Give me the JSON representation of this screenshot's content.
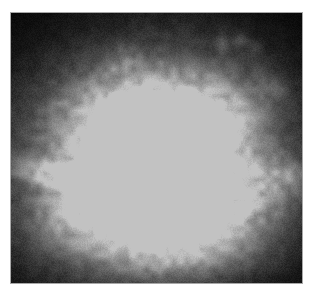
{
  "figure": {
    "kind": "astronomical-grayscale-image",
    "colormap": "grayscale",
    "background_color": "#000000",
    "page_color": "#ffffff",
    "border_color": "#a8a8a8",
    "panel": {
      "x": 10,
      "y": 12,
      "width": 293,
      "height": 272
    },
    "peak_brightness_hex": "#c2c2c2",
    "noise": {
      "type": "speckle",
      "amplitude": 18
    }
  },
  "chart_data": {
    "type": "heatmap",
    "title": "",
    "xlabel": "",
    "ylabel": "",
    "grid": false,
    "legend": "none",
    "xlim": [
      0,
      293
    ],
    "ylim": [
      0,
      272
    ],
    "value_range": [
      0,
      194
    ],
    "colormap": "gray",
    "sources": [
      {
        "name": "core",
        "cx": 145,
        "cy": 150,
        "rx": 46,
        "ry": 42,
        "peak": 194,
        "angle": 0
      },
      {
        "name": "inner-halo",
        "cx": 143,
        "cy": 152,
        "rx": 84,
        "ry": 74,
        "peak": 140,
        "angle": 0
      },
      {
        "name": "main-envelope",
        "cx": 140,
        "cy": 150,
        "rx": 130,
        "ry": 112,
        "peak": 96,
        "angle": -8
      },
      {
        "name": "outer-envelope",
        "cx": 138,
        "cy": 152,
        "rx": 158,
        "ry": 134,
        "peak": 52,
        "angle": -8
      },
      {
        "name": "upper-lobe",
        "cx": 130,
        "cy": 95,
        "rx": 86,
        "ry": 42,
        "peak": 78,
        "angle": -6
      },
      {
        "name": "upper-right-shoulder",
        "cx": 206,
        "cy": 110,
        "rx": 54,
        "ry": 38,
        "peak": 70,
        "angle": -20
      },
      {
        "name": "left-filament",
        "cx": 60,
        "cy": 160,
        "rx": 62,
        "ry": 9,
        "peak": 96,
        "angle": 10
      },
      {
        "name": "left-filament-outer",
        "cx": 28,
        "cy": 166,
        "rx": 34,
        "ry": 6,
        "peak": 58,
        "angle": 12
      },
      {
        "name": "right-spur",
        "cx": 252,
        "cy": 168,
        "rx": 42,
        "ry": 30,
        "peak": 58,
        "angle": 0
      },
      {
        "name": "right-spur-far",
        "cx": 280,
        "cy": 162,
        "rx": 22,
        "ry": 16,
        "peak": 40,
        "angle": 0
      },
      {
        "name": "lower-left-extension",
        "cx": 78,
        "cy": 196,
        "rx": 54,
        "ry": 40,
        "peak": 66,
        "angle": 0
      },
      {
        "name": "lower-envelope",
        "cx": 148,
        "cy": 208,
        "rx": 104,
        "ry": 50,
        "peak": 64,
        "angle": 0
      },
      {
        "name": "lower-right-knot",
        "cx": 214,
        "cy": 212,
        "rx": 52,
        "ry": 38,
        "peak": 54,
        "angle": 0
      },
      {
        "name": "lower-tail",
        "cx": 160,
        "cy": 240,
        "rx": 66,
        "ry": 22,
        "peak": 34,
        "angle": 0
      }
    ],
    "wisps": [
      {
        "name": "wisp-top-left",
        "cx": 114,
        "cy": 44,
        "rx": 16,
        "ry": 10,
        "peak": 30,
        "angle": 25
      },
      {
        "name": "wisp-top-left-b",
        "cx": 104,
        "cy": 56,
        "rx": 11,
        "ry": 7,
        "peak": 24,
        "angle": 0
      },
      {
        "name": "wisp-top-right-a",
        "cx": 212,
        "cy": 30,
        "rx": 7,
        "ry": 11,
        "peak": 36,
        "angle": 0
      },
      {
        "name": "wisp-top-right-b",
        "cx": 230,
        "cy": 28,
        "rx": 9,
        "ry": 8,
        "peak": 34,
        "angle": 0
      },
      {
        "name": "wisp-top-right-c",
        "cx": 243,
        "cy": 34,
        "rx": 6,
        "ry": 6,
        "peak": 26,
        "angle": 0
      },
      {
        "name": "wisp-right-upper",
        "cx": 258,
        "cy": 68,
        "rx": 10,
        "ry": 14,
        "peak": 28,
        "angle": -30
      },
      {
        "name": "wisp-right-mid",
        "cx": 272,
        "cy": 80,
        "rx": 8,
        "ry": 9,
        "peak": 22,
        "angle": 0
      },
      {
        "name": "wisp-bottom-mid",
        "cx": 150,
        "cy": 252,
        "rx": 22,
        "ry": 7,
        "peak": 18,
        "angle": 0
      }
    ]
  }
}
